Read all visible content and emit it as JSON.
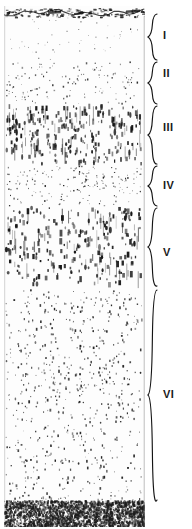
{
  "figure": {
    "kind": "histology-micrograph",
    "background_color": "#ffffff",
    "ink_color": "#141414",
    "tissue": {
      "left": 4,
      "top": 6,
      "width": 141,
      "height": 521,
      "pial_surface_label": "pial-surface",
      "white_matter_label": "white-matter-band"
    }
  },
  "layers": [
    {
      "label": "I",
      "name": "molecular-layer",
      "bracket_top": 14,
      "bracket_bottom": 60,
      "label_y": 30,
      "density": 0.22,
      "cell_scale": 0.55,
      "elongation": 1.0,
      "tone": "#3a3a3a"
    },
    {
      "label": "II",
      "name": "external-granular-layer",
      "bracket_top": 62,
      "bracket_bottom": 104,
      "label_y": 68,
      "density": 0.62,
      "cell_scale": 0.7,
      "elongation": 1.1,
      "tone": "#242424"
    },
    {
      "label": "III",
      "name": "external-pyramidal-layer",
      "bracket_top": 106,
      "bracket_bottom": 164,
      "label_y": 122,
      "density": 0.78,
      "cell_scale": 1.15,
      "elongation": 2.1,
      "tone": "#141414"
    },
    {
      "label": "IV",
      "name": "internal-granular-layer",
      "bracket_top": 166,
      "bracket_bottom": 206,
      "label_y": 180,
      "density": 0.86,
      "cell_scale": 0.68,
      "elongation": 1.05,
      "tone": "#1a1a1a"
    },
    {
      "label": "V",
      "name": "internal-pyramidal-layer",
      "bracket_top": 208,
      "bracket_bottom": 286,
      "label_y": 247,
      "density": 0.52,
      "cell_scale": 1.35,
      "elongation": 1.7,
      "tone": "#171717"
    },
    {
      "label": "VI",
      "name": "multiform-layer",
      "bracket_top": 290,
      "bracket_bottom": 500,
      "label_y": 389,
      "density": 0.58,
      "cell_scale": 0.82,
      "elongation": 1.3,
      "tone": "#202020"
    }
  ]
}
